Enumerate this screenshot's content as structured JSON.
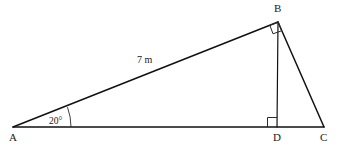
{
  "figure": {
    "type": "geometry-diagram",
    "background_color": "#ffffff",
    "line_color": "#111111",
    "width": 345,
    "height": 150
  },
  "vertices": [
    {
      "id": "A",
      "label": "A",
      "x": 13,
      "y": 127,
      "label_x": 9,
      "label_y": 141
    },
    {
      "id": "B",
      "label": "B",
      "x": 278,
      "y": 22,
      "label_x": 274,
      "label_y": 12
    },
    {
      "id": "C",
      "label": "C",
      "x": 324,
      "y": 127,
      "label_x": 320,
      "label_y": 141
    },
    {
      "id": "D",
      "label": "D",
      "x": 277,
      "y": 127,
      "label_x": 273,
      "label_y": 141
    }
  ],
  "segments": [
    {
      "id": "AB",
      "from": "A",
      "to": "B",
      "label": "7 m"
    },
    {
      "id": "AC",
      "from": "A",
      "to": "C",
      "label": ""
    },
    {
      "id": "BD",
      "from": "B",
      "to": "D",
      "label": ""
    },
    {
      "id": "BC",
      "from": "B",
      "to": "C",
      "label": ""
    }
  ],
  "measurements": {
    "side_ab": {
      "value": "7 m",
      "x": 142,
      "y": 63
    }
  },
  "angles": [
    {
      "id": "angle-A",
      "vertex": "A",
      "label": "20°",
      "value": 20,
      "unit": "degrees",
      "label_x": 50,
      "label_y": 124,
      "arc_radius": 58
    }
  ],
  "right_angle_markers": [
    {
      "id": "right-angle-B",
      "vertex": "B",
      "size": 9
    },
    {
      "id": "right-angle-D",
      "vertex": "D",
      "size": 9
    }
  ]
}
